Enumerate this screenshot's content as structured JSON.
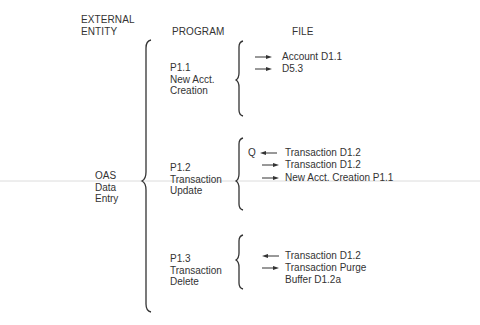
{
  "headers": {
    "external_entity": [
      "EXTERNAL",
      "ENTITY"
    ],
    "program": "PROGRAM",
    "file": "FILE"
  },
  "external_entity": {
    "lines": [
      "OAS",
      "Data",
      "Entry"
    ]
  },
  "programs": [
    {
      "id": "P1.1",
      "name_lines": [
        "New Acct.",
        "Creation"
      ],
      "files": [
        {
          "direction": "out",
          "prefix": "",
          "label": "Account D1.1"
        },
        {
          "direction": "out",
          "prefix": "",
          "label": "D5.3"
        }
      ]
    },
    {
      "id": "P1.2",
      "name_lines": [
        "Transaction",
        "Update"
      ],
      "files": [
        {
          "direction": "in",
          "prefix": "Q",
          "label": "Transaction D1.2"
        },
        {
          "direction": "out",
          "prefix": "",
          "label": "Transaction D1.2"
        },
        {
          "direction": "out",
          "prefix": "",
          "label": "New Acct. Creation P1.1"
        }
      ]
    },
    {
      "id": "P1.3",
      "name_lines": [
        "Transaction",
        "Delete"
      ],
      "files": [
        {
          "direction": "in",
          "prefix": "",
          "label": "Transaction D1.2"
        },
        {
          "direction": "out",
          "prefix": "",
          "label": "Transaction Purge",
          "continuation": "Buffer D1.2a"
        }
      ]
    }
  ],
  "colors": {
    "ink": "#333333",
    "rule": "#d9d9d9"
  }
}
